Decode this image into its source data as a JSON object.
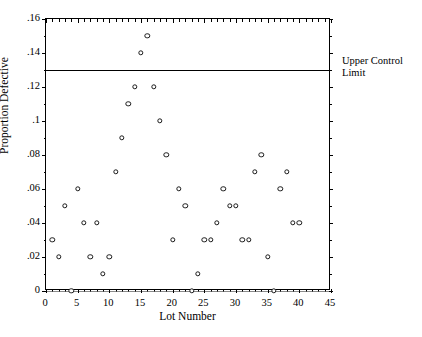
{
  "chart_data": {
    "type": "scatter",
    "title": "",
    "xlabel": "Lot Number",
    "ylabel": "Proportion Defective",
    "xlim": [
      0,
      45
    ],
    "ylim": [
      0,
      0.16
    ],
    "grid": false,
    "legend_position": "none",
    "x_ticks": [
      "0",
      "5",
      "10",
      "15",
      "20",
      "25",
      "30",
      "35",
      "40",
      "45"
    ],
    "x_tick_values": [
      0,
      5,
      10,
      15,
      20,
      25,
      30,
      35,
      40,
      45
    ],
    "x_minor_step": 1,
    "y_ticks": [
      "0",
      ".02",
      ".04",
      ".06",
      ".08",
      ".1",
      ".12",
      ".14",
      ".16"
    ],
    "y_tick_values": [
      0,
      0.02,
      0.04,
      0.06,
      0.08,
      0.1,
      0.12,
      0.14,
      0.16
    ],
    "y_minor_step": 0.01,
    "x": [
      1,
      2,
      3,
      4,
      5,
      6,
      7,
      8,
      9,
      10,
      11,
      12,
      13,
      14,
      15,
      16,
      17,
      18,
      19,
      20,
      21,
      22,
      23,
      24,
      25,
      26,
      27,
      28,
      29,
      30,
      31,
      32,
      33,
      34,
      35,
      36,
      37,
      38,
      39,
      40
    ],
    "y": [
      0.03,
      0.02,
      0.05,
      0.0,
      0.06,
      0.04,
      0.02,
      0.04,
      0.01,
      0.02,
      0.07,
      0.09,
      0.11,
      0.12,
      0.14,
      0.15,
      0.12,
      0.1,
      0.08,
      0.03,
      0.06,
      0.05,
      0.0,
      0.01,
      0.03,
      0.03,
      0.04,
      0.06,
      0.05,
      0.05,
      0.03,
      0.03,
      0.07,
      0.08,
      0.02,
      0.0,
      0.06,
      0.07,
      0.04,
      0.04
    ],
    "series": [
      {
        "name": "Proportion Defective",
        "marker": "open-circle",
        "color": "#1a1a1a"
      }
    ],
    "reference_lines": [
      {
        "name": "upper-control-limit",
        "value": 0.13,
        "label": "Upper Control",
        "label_line2": "Limit",
        "color": "#000000",
        "style": "solid"
      },
      {
        "name": "center-zero-line",
        "value": 0.0,
        "label": "",
        "color": "#8a8a8a",
        "style": "solid"
      }
    ]
  },
  "annotations": {
    "ucl_label_line1": "Upper Control",
    "ucl_label_line2": "Limit"
  }
}
